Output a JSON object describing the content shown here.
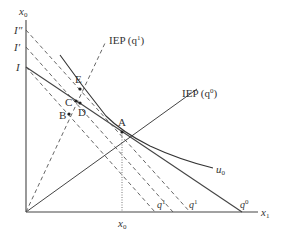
{
  "diagram": {
    "type": "economics-indifference-diagram",
    "axes": {
      "y_label": "x",
      "y_label_sub": "0",
      "x_label": "x",
      "x_label_sub": "1",
      "x_tick_label": "x",
      "x_tick_label_sub": "0"
    },
    "intercepts": {
      "I": "I",
      "I_prime": "I′",
      "I_double_prime": "I″"
    },
    "curves": {
      "iep_q1": "IEP (q",
      "iep_q1_sup": "1",
      "iep_q1_close": ")",
      "iep_q0": "IEP (q",
      "iep_q0_sup": "0",
      "iep_q0_close": ")",
      "indifference": "u",
      "indifference_sub": "0"
    },
    "budget_labels": {
      "q1_a": "q",
      "q1_a_sup": "1",
      "q1_b": "q",
      "q1_b_sup": "1",
      "q0": "q",
      "q0_sup": "0"
    },
    "points": {
      "A": "A",
      "B": "B",
      "C": "C",
      "D": "D",
      "E": "E"
    },
    "colors": {
      "line": "#444444",
      "text": "#333333"
    }
  }
}
